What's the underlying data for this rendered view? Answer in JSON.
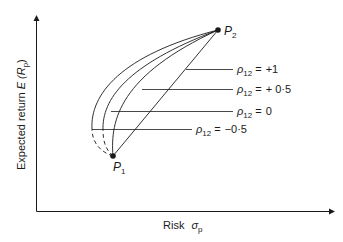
{
  "diagram": {
    "axes": {
      "y_label_main": "Expected return ",
      "y_label_E": "E",
      "y_label_R": "(R",
      "y_label_sub": "p",
      "y_label_close": ")",
      "x_label_main": "Risk",
      "x_label_sigma": "σ",
      "x_label_sub": "p"
    },
    "points": [
      {
        "name": "P",
        "sub": "1"
      },
      {
        "name": "P",
        "sub": "2"
      }
    ],
    "curves": [
      {
        "rho_symbol": "ρ",
        "rho_sub": "12",
        "eq": "=",
        "value": "+1"
      },
      {
        "rho_symbol": "ρ",
        "rho_sub": "12",
        "eq": "=",
        "value": "+ 0·5"
      },
      {
        "rho_symbol": "ρ",
        "rho_sub": "12",
        "eq": "=",
        "value": "0"
      },
      {
        "rho_symbol": "ρ",
        "rho_sub": "12",
        "eq": "=",
        "value": "−0·5"
      }
    ],
    "colors": {
      "ink": "#1a1a1a",
      "background": "#ffffff"
    }
  }
}
